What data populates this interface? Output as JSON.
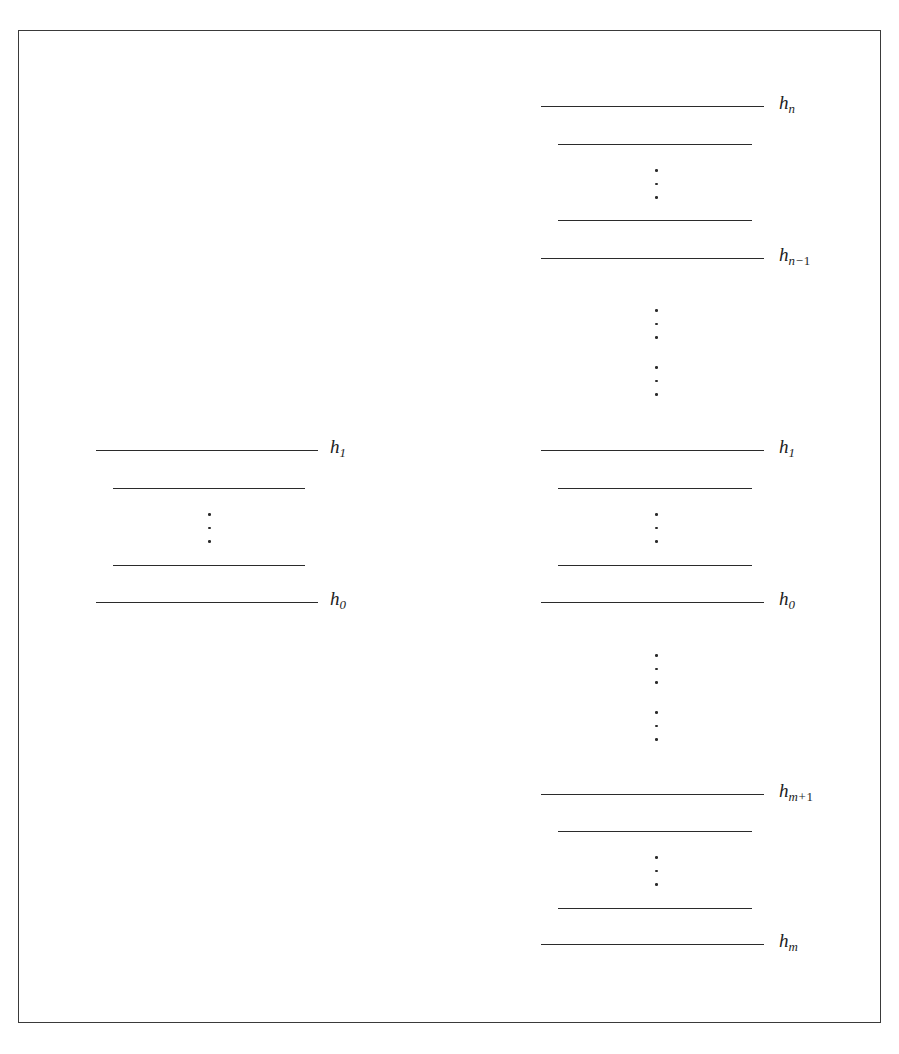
{
  "figure": {
    "type": "energy-level-diagram",
    "background_color": "#ffffff",
    "line_color": "#2b2b2b",
    "frame_color": "#3a3a3a",
    "label_color": "#1c1c1c"
  },
  "columns": [
    {
      "id": "left-ladder",
      "name": "left-level-ladder",
      "levels": [
        {
          "id": "l-h1",
          "label": "h",
          "sub": "1",
          "sub_op": "",
          "sub_tail": "",
          "labeled": true,
          "x": 96,
          "width": 222,
          "y": 450
        },
        {
          "id": "l-u1",
          "label": "",
          "sub": "",
          "sub_op": "",
          "sub_tail": "",
          "labeled": false,
          "x": 113,
          "width": 192,
          "y": 488
        },
        {
          "id": "l-u2",
          "label": "",
          "sub": "",
          "sub_op": "",
          "sub_tail": "",
          "labeled": false,
          "x": 113,
          "width": 192,
          "y": 565
        },
        {
          "id": "l-h0",
          "label": "h",
          "sub": "0",
          "sub_op": "",
          "sub_tail": "",
          "labeled": true,
          "x": 96,
          "width": 222,
          "y": 602
        }
      ],
      "ellipses": [
        {
          "id": "l-dots-1",
          "x": 209,
          "y": 513,
          "height": 30
        }
      ],
      "label_x": 330
    },
    {
      "id": "right-ladder",
      "name": "right-level-ladder",
      "levels": [
        {
          "id": "r-hn",
          "label": "h",
          "sub": "n",
          "sub_op": "−",
          "sub_tail": "",
          "labeled": true,
          "x": 541,
          "width": 223,
          "y": 106,
          "show_op": false
        },
        {
          "id": "r-u1",
          "label": "",
          "sub": "",
          "sub_op": "",
          "sub_tail": "",
          "labeled": false,
          "x": 558,
          "width": 194,
          "y": 144,
          "show_op": false
        },
        {
          "id": "r-u2",
          "label": "",
          "sub": "",
          "sub_op": "",
          "sub_tail": "",
          "labeled": false,
          "x": 558,
          "width": 194,
          "y": 220,
          "show_op": false
        },
        {
          "id": "r-hn1",
          "label": "h",
          "sub": "n",
          "sub_op": "−",
          "sub_tail": "1",
          "labeled": true,
          "x": 541,
          "width": 223,
          "y": 258,
          "show_op": true
        },
        {
          "id": "r-h1",
          "label": "h",
          "sub": "1",
          "sub_op": "",
          "sub_tail": "",
          "labeled": true,
          "x": 541,
          "width": 223,
          "y": 450,
          "show_op": false
        },
        {
          "id": "r-u3",
          "label": "",
          "sub": "",
          "sub_op": "",
          "sub_tail": "",
          "labeled": false,
          "x": 558,
          "width": 194,
          "y": 488,
          "show_op": false
        },
        {
          "id": "r-u4",
          "label": "",
          "sub": "",
          "sub_op": "",
          "sub_tail": "",
          "labeled": false,
          "x": 558,
          "width": 194,
          "y": 565,
          "show_op": false
        },
        {
          "id": "r-h0",
          "label": "h",
          "sub": "0",
          "sub_op": "",
          "sub_tail": "",
          "labeled": true,
          "x": 541,
          "width": 223,
          "y": 602,
          "show_op": false
        },
        {
          "id": "r-hm1",
          "label": "h",
          "sub": "m",
          "sub_op": "+",
          "sub_tail": "1",
          "labeled": true,
          "x": 541,
          "width": 223,
          "y": 794,
          "show_op": true
        },
        {
          "id": "r-u5",
          "label": "",
          "sub": "",
          "sub_op": "",
          "sub_tail": "",
          "labeled": false,
          "x": 558,
          "width": 194,
          "y": 831,
          "show_op": false
        },
        {
          "id": "r-u6",
          "label": "",
          "sub": "",
          "sub_op": "",
          "sub_tail": "",
          "labeled": false,
          "x": 558,
          "width": 194,
          "y": 908,
          "show_op": false
        },
        {
          "id": "r-hm",
          "label": "h",
          "sub": "m",
          "sub_op": "",
          "sub_tail": "",
          "labeled": true,
          "x": 541,
          "width": 223,
          "y": 944,
          "show_op": false
        }
      ],
      "ellipses": [
        {
          "id": "r-dots-1",
          "x": 656,
          "y": 169,
          "height": 30
        },
        {
          "id": "r-dots-2",
          "x": 656,
          "y": 309,
          "height": 30
        },
        {
          "id": "r-dots-3",
          "x": 656,
          "y": 366,
          "height": 30
        },
        {
          "id": "r-dots-4",
          "x": 656,
          "y": 513,
          "height": 30
        },
        {
          "id": "r-dots-5",
          "x": 656,
          "y": 654,
          "height": 30
        },
        {
          "id": "r-dots-6",
          "x": 656,
          "y": 711,
          "height": 30
        },
        {
          "id": "r-dots-7",
          "x": 656,
          "y": 856,
          "height": 30
        }
      ],
      "label_x": 779
    }
  ],
  "labels": {
    "h_n": "h n",
    "h_n_minus_1": "h n-1",
    "h_1": "h 1",
    "h_0": "h 0",
    "h_m_plus_1": "h m+1",
    "h_m": "h m"
  }
}
